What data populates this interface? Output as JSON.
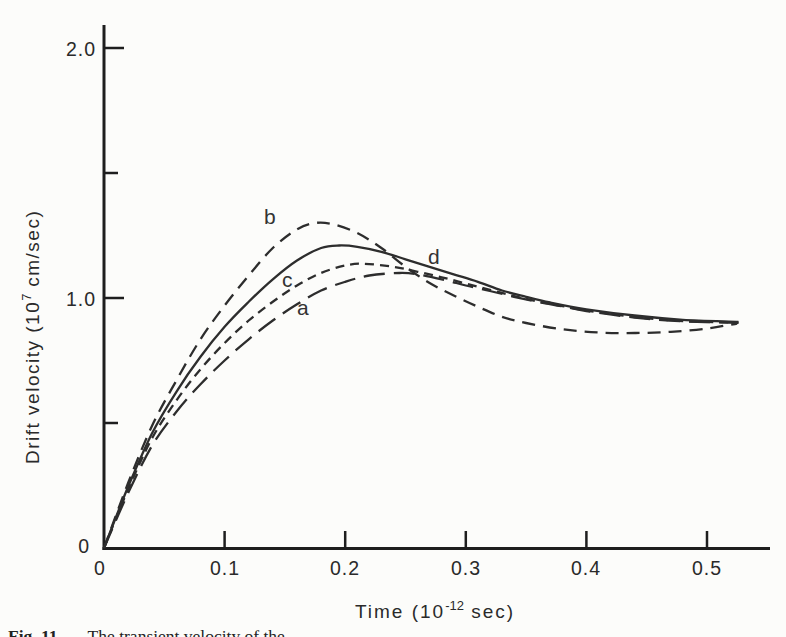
{
  "figure": {
    "caption_prefix": "Fig. 11",
    "caption_text": "The transient velocity of the"
  },
  "chart_data": {
    "type": "line",
    "title": "",
    "xlabel": "Time (10^-12 sec)",
    "ylabel": "Drift velocity (10^7 cm/sec)",
    "xlabel_parts": [
      "Time (10",
      "-12",
      " sec)"
    ],
    "ylabel_parts": [
      "Drift velocity (10",
      "7",
      " cm/sec)"
    ],
    "xlim": [
      0,
      0.553
    ],
    "ylim": [
      0,
      2.09
    ],
    "grid": false,
    "legend": "inline curve labels",
    "axis_color": "#1e1e1e",
    "curve_color": "#2d2d2d",
    "x_origin_label": "0",
    "y_origin_label": "0",
    "x_ticks": [
      {
        "value": 0.1,
        "label": "0.1"
      },
      {
        "value": 0.2,
        "label": "0.2"
      },
      {
        "value": 0.3,
        "label": "0.3"
      },
      {
        "value": 0.4,
        "label": "0.4"
      },
      {
        "value": 0.5,
        "label": "0.5"
      }
    ],
    "y_ticks": [
      {
        "value": 0.5,
        "label": ""
      },
      {
        "value": 1.0,
        "label": "1.0"
      },
      {
        "value": 1.5,
        "label": ""
      },
      {
        "value": 2.0,
        "label": "2.0"
      }
    ],
    "series": [
      {
        "name": "a",
        "label": "a",
        "line_style": "long-dash",
        "peak": {
          "t": 0.245,
          "v": 1.1
        },
        "points": [
          [
            0,
            0
          ],
          [
            0.02,
            0.22
          ],
          [
            0.04,
            0.41
          ],
          [
            0.06,
            0.545
          ],
          [
            0.08,
            0.655
          ],
          [
            0.1,
            0.75
          ],
          [
            0.12,
            0.835
          ],
          [
            0.14,
            0.91
          ],
          [
            0.16,
            0.975
          ],
          [
            0.18,
            1.03
          ],
          [
            0.2,
            1.065
          ],
          [
            0.22,
            1.09
          ],
          [
            0.245,
            1.1
          ],
          [
            0.26,
            1.095
          ],
          [
            0.28,
            1.075
          ],
          [
            0.3,
            1.05
          ],
          [
            0.32,
            1.028
          ],
          [
            0.34,
            1.005
          ],
          [
            0.36,
            0.984
          ],
          [
            0.38,
            0.967
          ],
          [
            0.4,
            0.948
          ],
          [
            0.44,
            0.922
          ],
          [
            0.48,
            0.907
          ],
          [
            0.526,
            0.901
          ]
        ]
      },
      {
        "name": "b",
        "label": "b",
        "line_style": "dash",
        "peak": {
          "t": 0.175,
          "v": 1.3
        },
        "points": [
          [
            0,
            0
          ],
          [
            0.02,
            0.26
          ],
          [
            0.04,
            0.49
          ],
          [
            0.06,
            0.67
          ],
          [
            0.08,
            0.835
          ],
          [
            0.1,
            0.97
          ],
          [
            0.12,
            1.09
          ],
          [
            0.14,
            1.2
          ],
          [
            0.16,
            1.275
          ],
          [
            0.175,
            1.3
          ],
          [
            0.19,
            1.295
          ],
          [
            0.21,
            1.26
          ],
          [
            0.23,
            1.2
          ],
          [
            0.25,
            1.125
          ],
          [
            0.27,
            1.06
          ],
          [
            0.29,
            1.01
          ],
          [
            0.31,
            0.965
          ],
          [
            0.33,
            0.925
          ],
          [
            0.35,
            0.9
          ],
          [
            0.38,
            0.875
          ],
          [
            0.41,
            0.862
          ],
          [
            0.44,
            0.86
          ],
          [
            0.47,
            0.865
          ],
          [
            0.5,
            0.878
          ],
          [
            0.525,
            0.898
          ]
        ]
      },
      {
        "name": "c",
        "label": "c",
        "line_style": "short-dash",
        "peak": {
          "t": 0.215,
          "v": 1.14
        },
        "points": [
          [
            0,
            0
          ],
          [
            0.02,
            0.235
          ],
          [
            0.04,
            0.44
          ],
          [
            0.06,
            0.59
          ],
          [
            0.08,
            0.715
          ],
          [
            0.1,
            0.82
          ],
          [
            0.12,
            0.91
          ],
          [
            0.14,
            0.985
          ],
          [
            0.16,
            1.05
          ],
          [
            0.18,
            1.1
          ],
          [
            0.2,
            1.13
          ],
          [
            0.215,
            1.137
          ],
          [
            0.24,
            1.125
          ],
          [
            0.26,
            1.105
          ],
          [
            0.28,
            1.083
          ],
          [
            0.3,
            1.058
          ],
          [
            0.32,
            1.033
          ],
          [
            0.34,
            1.008
          ],
          [
            0.36,
            0.986
          ],
          [
            0.38,
            0.968
          ],
          [
            0.4,
            0.95
          ],
          [
            0.44,
            0.924
          ],
          [
            0.48,
            0.908
          ],
          [
            0.526,
            0.902
          ]
        ]
      },
      {
        "name": "d",
        "label": "d",
        "line_style": "solid",
        "peak": {
          "t": 0.195,
          "v": 1.21
        },
        "points": [
          [
            0,
            0
          ],
          [
            0.02,
            0.245
          ],
          [
            0.04,
            0.46
          ],
          [
            0.06,
            0.625
          ],
          [
            0.08,
            0.765
          ],
          [
            0.1,
            0.885
          ],
          [
            0.12,
            0.985
          ],
          [
            0.14,
            1.075
          ],
          [
            0.16,
            1.15
          ],
          [
            0.18,
            1.2
          ],
          [
            0.195,
            1.21
          ],
          [
            0.21,
            1.205
          ],
          [
            0.23,
            1.185
          ],
          [
            0.25,
            1.155
          ],
          [
            0.27,
            1.125
          ],
          [
            0.29,
            1.095
          ],
          [
            0.31,
            1.065
          ],
          [
            0.33,
            1.03
          ],
          [
            0.35,
            1.005
          ],
          [
            0.37,
            0.982
          ],
          [
            0.4,
            0.955
          ],
          [
            0.44,
            0.93
          ],
          [
            0.48,
            0.913
          ],
          [
            0.526,
            0.905
          ]
        ]
      }
    ]
  }
}
